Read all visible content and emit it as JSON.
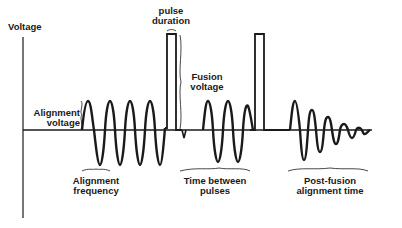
{
  "diagram": {
    "axis": {
      "y_label": "Voltage"
    },
    "labels": {
      "alignment_voltage": [
        "Alignment",
        "voltage"
      ],
      "alignment_frequency": [
        "Alignment",
        "frequency"
      ],
      "pulse_duration": [
        "pulse",
        "duration"
      ],
      "fusion_voltage": [
        "Fusion",
        "voltage"
      ],
      "time_between_pulses": [
        "Time between",
        "pulses"
      ],
      "post_fusion_alignment_time": [
        "Post-fusion",
        "alignment time"
      ]
    },
    "colors": {
      "line": "#1a1a1a",
      "background": "#ffffff"
    }
  }
}
